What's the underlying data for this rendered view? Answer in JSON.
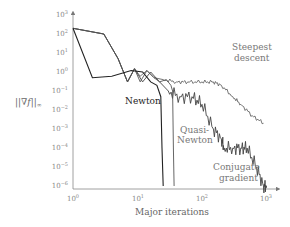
{
  "chart_data": {
    "type": "line",
    "title": "",
    "xlabel": "Major iterations",
    "ylabel": "||∇f||∞",
    "xscale": "log",
    "yscale": "log",
    "xlim": [
      1,
      1000
    ],
    "ylim": [
      1e-06,
      1000
    ],
    "x_ticks": [
      "10^0",
      "10^1",
      "10^2",
      "10^3"
    ],
    "y_ticks": [
      "10^3",
      "10^2",
      "10^1",
      "10^0",
      "10^-1",
      "10^-2",
      "10^-3",
      "10^-4",
      "10^-5",
      "10^-6"
    ],
    "grid": false,
    "legend": "inline annotations",
    "series": [
      {
        "name": "Newton",
        "color": "#222222",
        "x": [
          1,
          2,
          4,
          8,
          12,
          16,
          20,
          23,
          24,
          25
        ],
        "y": [
          200,
          0.5,
          0.6,
          1.2,
          1.0,
          0.3,
          0.2,
          0.05,
          0.0001,
          1e-06
        ]
      },
      {
        "name": "Quasi-Newton",
        "color": "#555555",
        "x": [
          1,
          3,
          5,
          7,
          9,
          11,
          14,
          18,
          22,
          28,
          33,
          35,
          36,
          37
        ],
        "y": [
          200,
          100,
          5,
          0.3,
          1.5,
          0.3,
          1.2,
          0.5,
          0.3,
          0.4,
          0.2,
          0.1,
          0.0001,
          1e-06
        ]
      },
      {
        "name": "Steepest descent",
        "color": "#666666",
        "x": [
          1,
          3,
          5,
          7,
          9,
          11,
          14,
          18,
          25,
          40,
          60,
          100,
          150,
          200,
          300,
          400,
          600,
          900
        ],
        "y": [
          200,
          100,
          5,
          0.3,
          1.5,
          0.6,
          1.2,
          0.5,
          0.4,
          0.3,
          0.3,
          0.3,
          0.3,
          0.2,
          0.05,
          0.02,
          0.005,
          0.002
        ]
      },
      {
        "name": "Conjugate gradient",
        "color": "#444444",
        "x": [
          1,
          3,
          5,
          7,
          9,
          12,
          16,
          22,
          30,
          45,
          70,
          100,
          150,
          200,
          220,
          300,
          400,
          500,
          700,
          900,
          1000
        ],
        "y": [
          200,
          100,
          5,
          0.3,
          1.5,
          0.3,
          1.0,
          0.3,
          0.1,
          0.05,
          0.05,
          0.02,
          0.001,
          0.0003,
          0.0001,
          0.0001,
          0.0001,
          0.0001,
          1e-05,
          1e-06,
          1e-06
        ]
      }
    ],
    "annotations": [
      "Newton",
      "Quasi-Newton",
      "Steepest descent",
      "Conjugate gradient"
    ]
  },
  "axes": {
    "xlabel": "Major iterations",
    "ylabel_main": "||∇f||",
    "ylabel_sub": "∞",
    "x_tick_labels": [
      {
        "base": "10",
        "exp": "0"
      },
      {
        "base": "10",
        "exp": "1"
      },
      {
        "base": "10",
        "exp": "2"
      },
      {
        "base": "10",
        "exp": "3"
      }
    ],
    "y_tick_labels": [
      {
        "base": "10",
        "exp": "3"
      },
      {
        "base": "10",
        "exp": "2"
      },
      {
        "base": "10",
        "exp": "1"
      },
      {
        "base": "10",
        "exp": "0"
      },
      {
        "base": "10",
        "exp": "−1"
      },
      {
        "base": "10",
        "exp": "−2"
      },
      {
        "base": "10",
        "exp": "−3"
      },
      {
        "base": "10",
        "exp": "−4"
      },
      {
        "base": "10",
        "exp": "−5"
      },
      {
        "base": "10",
        "exp": "−6"
      }
    ]
  },
  "labels": {
    "newton": "Newton",
    "quasi_1": "Quasi-",
    "quasi_2": "Newton",
    "steep_1": "Steepest",
    "steep_2": "descent",
    "cg_1": "Conjugate",
    "cg_2": "gradient"
  }
}
